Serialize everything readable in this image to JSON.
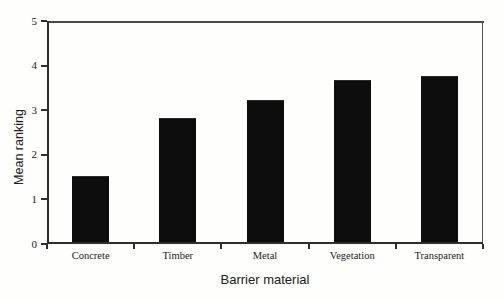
{
  "chart_data": {
    "type": "bar",
    "title": "",
    "categories": [
      "Concrete",
      "Timber",
      "Metal",
      "Vegetation",
      "Transparent"
    ],
    "values": [
      1.5,
      2.8,
      3.2,
      3.65,
      3.75
    ],
    "xlabel": "Barrier material",
    "ylabel": "Mean ranking",
    "ylim": [
      0,
      5
    ],
    "yticks": [
      "0",
      "1",
      "2",
      "3",
      "4",
      "5"
    ],
    "grid": false,
    "legend": false,
    "bar_color": "#0d0d0d",
    "axis_color": "#2e2e2e",
    "background_color": "#fefefd"
  }
}
